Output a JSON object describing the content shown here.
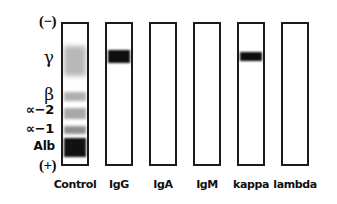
{
  "figure": {
    "type": "immunofixation-electrophoresis-gel",
    "background_color": "#ffffff",
    "ink_color": "#1a1a1a",
    "width": 337,
    "height": 204
  },
  "axis": {
    "polarity_top": "(−)",
    "polarity_bottom": "(+)",
    "fractions": [
      {
        "name": "gamma",
        "label": "γ"
      },
      {
        "name": "beta",
        "label": "β"
      },
      {
        "name": "alpha-2",
        "label": "∝−2"
      },
      {
        "name": "alpha-1",
        "label": "∝−1"
      },
      {
        "name": "albumin",
        "label": "Alb"
      }
    ]
  },
  "lanes": [
    {
      "id": "control",
      "label": "Control",
      "x": 61,
      "bands": [
        {
          "fraction": "gamma",
          "top": 22,
          "height": 30,
          "color": "#b8b8b8",
          "blur": 2.4,
          "name": "band-gamma"
        },
        {
          "fraction": "beta",
          "top": 68,
          "height": 9,
          "color": "#b0b0b0",
          "blur": 1.6,
          "name": "band-beta"
        },
        {
          "fraction": "alpha-2",
          "top": 84,
          "height": 11,
          "color": "#a8a8a8",
          "blur": 1.6,
          "name": "band-alpha-2"
        },
        {
          "fraction": "alpha-1",
          "top": 102,
          "height": 8,
          "color": "#8f8f8f",
          "blur": 1.5,
          "name": "band-alpha-1"
        },
        {
          "fraction": "albumin",
          "top": 114,
          "height": 19,
          "color": "#111111",
          "blur": 1.2,
          "name": "band-albumin"
        }
      ]
    },
    {
      "id": "igg",
      "label": "IgG",
      "x": 105,
      "bands": [
        {
          "fraction": "gamma",
          "top": 26,
          "height": 13,
          "color": "#0d0d0d",
          "blur": 1.2,
          "name": "band-monoclonal-igg"
        }
      ]
    },
    {
      "id": "iga",
      "label": "IgA",
      "x": 149,
      "bands": []
    },
    {
      "id": "igm",
      "label": "IgM",
      "x": 193,
      "bands": []
    },
    {
      "id": "kappa",
      "label": "kappa",
      "x": 237,
      "bands": [
        {
          "fraction": "gamma",
          "top": 28,
          "height": 9,
          "color": "#0d0d0d",
          "blur": 1.1,
          "name": "band-monoclonal-kappa"
        }
      ]
    },
    {
      "id": "lambda",
      "label": "lambda",
      "x": 281,
      "bands": []
    }
  ],
  "label_positions": {
    "neg": {
      "top": 14,
      "right": 56
    },
    "gamma": {
      "top": 49,
      "right": 54
    },
    "beta": {
      "top": 86,
      "right": 54
    },
    "alpha2": {
      "top": 103,
      "right": 54
    },
    "alpha1": {
      "top": 122,
      "right": 54
    },
    "alb": {
      "top": 140,
      "right": 55
    },
    "pos": {
      "top": 158,
      "right": 56
    }
  }
}
